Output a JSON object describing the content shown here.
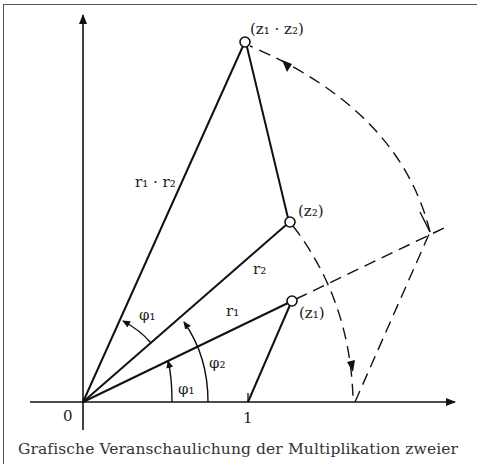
{
  "figure": {
    "type": "complex-multiplication-diagram",
    "caption": "Grafische Veranschaulichung der Multiplikation zweier",
    "labels": {
      "origin": "0",
      "unit": "1",
      "z1": "(z₁)",
      "z2": "(z₂)",
      "product": "(z₁ · z₂)",
      "r1": "r₁",
      "r2": "r₂",
      "r1r2": "r₁ · r₂",
      "phi1_lower": "φ₁",
      "phi2": "φ₂",
      "phi1_upper": "φ₁"
    },
    "points": {
      "origin": [
        83,
        402
      ],
      "unit": [
        248,
        402
      ],
      "z1": [
        292,
        301
      ],
      "z2": [
        290,
        222
      ],
      "product": [
        245,
        42
      ],
      "construction": [
        430,
        232
      ],
      "arc_foot": [
        355,
        402
      ]
    },
    "colors": {
      "ink": "#111111",
      "text": "#222222",
      "frame": "#555555",
      "background": "#ffffff"
    }
  }
}
